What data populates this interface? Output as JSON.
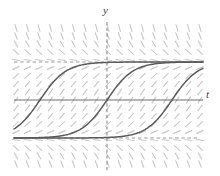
{
  "figure": {
    "kind": "direction-field-with-solution-curves",
    "caption": "",
    "background_color": "#ffffff",
    "width": 220,
    "height": 176
  },
  "axes": {
    "vertical": {
      "label": "y",
      "name": "y-axis",
      "x": 107,
      "y_top": 22,
      "y_bottom": 172,
      "color": "#8c8c8c",
      "style": "dashed"
    },
    "horizontal": {
      "label": "t",
      "name": "t-axis",
      "y": 100,
      "x_left": 14,
      "x_right": 203,
      "color": "#6e6e6e",
      "style": "solid"
    },
    "label_y_text": "y",
    "label_t_text": "t"
  },
  "equilibria": [
    {
      "name": "upper-equilibrium",
      "y_pixel": 62,
      "color": "#9a9a9a",
      "style": "dashed",
      "x_left": 14,
      "x_right": 200
    },
    {
      "name": "lower-equilibrium",
      "y_pixel": 138,
      "color": "#9a9a9a",
      "style": "dashed",
      "x_left": 14,
      "x_right": 200
    }
  ],
  "solution_curves": {
    "color": "#5a5a5a",
    "stroke_width": 1.5,
    "upper_asymptote_y": 62,
    "lower_asymptote_y": 138,
    "curves": [
      {
        "name": "solution-curve-left",
        "inflection_t": 40,
        "steepness": 13
      },
      {
        "name": "solution-curve-middle",
        "inflection_t": 107,
        "steepness": 13
      },
      {
        "name": "solution-curve-right",
        "inflection_t": 172,
        "steepness": 13
      }
    ]
  },
  "slope_field": {
    "name": "slope-field",
    "color": "#c9c9c9",
    "stroke_width": 1.1,
    "tick_length": 7,
    "x_start": 16,
    "x_end": 200,
    "x_step": 11.5,
    "y_start": 28,
    "y_end": 170,
    "y_step": 8.0,
    "upper_equilibrium_y": 62,
    "lower_equilibrium_y": 138,
    "description": "Short line segments whose slope matches dy/dt of an autonomous equation; nearly horizontal along the two equilibrium lines, steeply inclined away from them."
  },
  "chart_data": {
    "type": "line",
    "title": "",
    "xlabel": "t",
    "ylabel": "y",
    "xlim": [
      -8.1,
      8.3
    ],
    "ylim": [
      -1.55,
      2.55
    ],
    "grid": false,
    "legend": false,
    "annotations": [
      "Direction field of an autonomous first-order differential equation",
      "Two horizontal equilibrium solutions bound the sigmoid solution curves",
      "Three translated solution curves increase monotonically from the lower to the upper equilibrium"
    ],
    "equilibrium_values": [
      1.0,
      0.0
    ],
    "series": [
      {
        "name": "solution curve left",
        "inflection_x": -5.75,
        "comment": "sigmoid rising from lower to upper equilibrium"
      },
      {
        "name": "solution curve middle",
        "inflection_x": 0.0,
        "comment": "sigmoid through the origin region"
      },
      {
        "name": "solution curve right",
        "inflection_x": 5.6,
        "comment": "sigmoid rising from lower to upper equilibrium"
      }
    ]
  }
}
